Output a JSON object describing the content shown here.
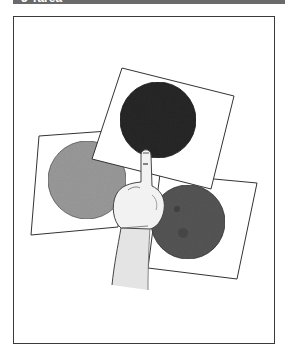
{
  "header": {
    "title": "3 Tarea",
    "background": "#6a6a6a"
  },
  "illustration": {
    "description": "A hand pointing at a dark circle on one of three overlapping cards",
    "cards": [
      {
        "name": "left-card",
        "circle_color": "#9a9a9a",
        "circle_label": "light-grey circle"
      },
      {
        "name": "right-card",
        "circle_color": "#555555",
        "circle_label": "dark-grey circle"
      },
      {
        "name": "top-card",
        "circle_color": "#262626",
        "circle_label": "black circle"
      }
    ],
    "pointer": "hand-pointing"
  }
}
